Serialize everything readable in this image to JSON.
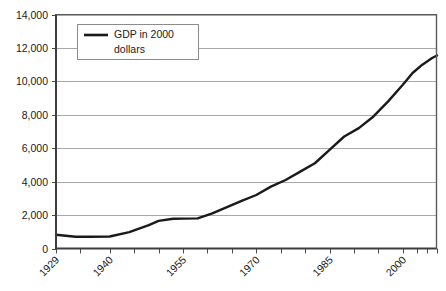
{
  "chart_data": {
    "type": "line",
    "title": "",
    "subtitle": "",
    "xlabel": "",
    "ylabel": "",
    "xlim": [
      1929,
      2007
    ],
    "ylim": [
      0,
      14000
    ],
    "grid": "horizontal",
    "legend_position": "top-left-inside",
    "y_ticks": [
      0,
      2000,
      4000,
      6000,
      8000,
      10000,
      12000,
      14000
    ],
    "y_tick_labels": [
      "0",
      "2,000",
      "4,000",
      "6,000",
      "8,000",
      "10,000",
      "12,000",
      "14,000"
    ],
    "x_tick_labels": [
      "1929",
      "1940",
      "1955",
      "1970",
      "1985",
      "2000"
    ],
    "x_tick_label_values": [
      1929,
      1940,
      1955,
      1970,
      1985,
      2000
    ],
    "x_minor_tick_values": [
      1929,
      1934,
      1940,
      1945,
      1950,
      1955,
      1960,
      1965,
      1970,
      1975,
      1980,
      1985,
      1990,
      1995,
      2000,
      2003,
      2005,
      2007
    ],
    "series": [
      {
        "name": "GDP in 2000 dollars",
        "color": "#1a1a1a",
        "line_width": 2.4,
        "x": [
          1929,
          1933,
          1936,
          1940,
          1944,
          1948,
          1950,
          1953,
          1955,
          1958,
          1961,
          1964,
          1967,
          1970,
          1973,
          1976,
          1979,
          1982,
          1985,
          1988,
          1991,
          1994,
          1997,
          2000,
          2002,
          2004,
          2006,
          2007
        ],
        "values": [
          820,
          700,
          700,
          720,
          980,
          1400,
          1650,
          1780,
          1790,
          1800,
          2100,
          2480,
          2850,
          3200,
          3700,
          4100,
          4600,
          5100,
          5900,
          6700,
          7200,
          7900,
          8800,
          9800,
          10500,
          11000,
          11400,
          11550
        ]
      }
    ]
  },
  "legend": {
    "entries": [
      {
        "label_line1": "GDP in 2000",
        "label_line2": "dollars",
        "swatch": "line-swatch"
      }
    ]
  },
  "colors": {
    "line": "#1a1a1a",
    "gridline": "#a8a8a8",
    "axis": "#4a4a4a",
    "plot_background": "#ffffff",
    "legend_border": "#8c8c8c",
    "text": "#1a1a1a"
  },
  "caption": {
    "text": ""
  }
}
